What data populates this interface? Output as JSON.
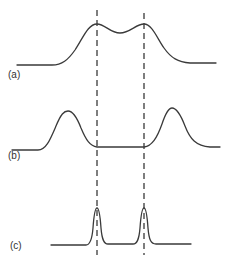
{
  "figure": {
    "panels": [
      {
        "id": "a",
        "label": "(a)",
        "description": "Two broad overlapping peaks, unresolved, with a shallow dip between them"
      },
      {
        "id": "b",
        "label": "(b)",
        "description": "Two broad peaks widely separated, positioned outside the reference lines"
      },
      {
        "id": "c",
        "label": "(c)",
        "description": "Two narrow sharp peaks aligned with the reference lines, fully resolved"
      }
    ],
    "reference_lines": {
      "style": "dashed",
      "count": 2,
      "x_positions_px": [
        97,
        144
      ]
    },
    "colors": {
      "stroke": "#3a3a3a",
      "background": "#ffffff"
    }
  }
}
